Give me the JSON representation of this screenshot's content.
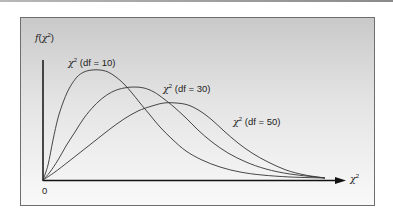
{
  "chart_data": {
    "type": "line",
    "title": "",
    "xlabel": "χ²",
    "ylabel": "f(χ²)",
    "origin_label": "0",
    "grid": false,
    "legend": "inline labels",
    "series": [
      {
        "name": "χ² (df = 10)",
        "df": 10,
        "label_pos": [
          68,
          57
        ],
        "points": [
          [
            43,
            180
          ],
          [
            48,
            165
          ],
          [
            53,
            140
          ],
          [
            58,
            118
          ],
          [
            64,
            100
          ],
          [
            70,
            87
          ],
          [
            77,
            77
          ],
          [
            84,
            72
          ],
          [
            92,
            70
          ],
          [
            100,
            70
          ],
          [
            108,
            72
          ],
          [
            116,
            77
          ],
          [
            124,
            84
          ],
          [
            132,
            93
          ],
          [
            140,
            103
          ],
          [
            150,
            115
          ],
          [
            160,
            127
          ],
          [
            172,
            139
          ],
          [
            186,
            151
          ],
          [
            202,
            160
          ],
          [
            220,
            167
          ],
          [
            240,
            172
          ],
          [
            262,
            175
          ],
          [
            290,
            177
          ],
          [
            325,
            178
          ]
        ]
      },
      {
        "name": "χ² (df = 30)",
        "df": 30,
        "label_pos": [
          163,
          83
        ],
        "points": [
          [
            43,
            180
          ],
          [
            50,
            172
          ],
          [
            58,
            160
          ],
          [
            66,
            146
          ],
          [
            75,
            132
          ],
          [
            84,
            118
          ],
          [
            94,
            106
          ],
          [
            104,
            97
          ],
          [
            114,
            91
          ],
          [
            124,
            88
          ],
          [
            134,
            87
          ],
          [
            144,
            88
          ],
          [
            154,
            92
          ],
          [
            164,
            99
          ],
          [
            174,
            107
          ],
          [
            186,
            118
          ],
          [
            198,
            130
          ],
          [
            212,
            142
          ],
          [
            228,
            153
          ],
          [
            246,
            162
          ],
          [
            266,
            169
          ],
          [
            290,
            174
          ],
          [
            325,
            178
          ]
        ]
      },
      {
        "name": "χ² (df = 50)",
        "df": 50,
        "label_pos": [
          233,
          116
        ],
        "points": [
          [
            43,
            180
          ],
          [
            55,
            172
          ],
          [
            68,
            162
          ],
          [
            82,
            151
          ],
          [
            96,
            140
          ],
          [
            110,
            129
          ],
          [
            124,
            119
          ],
          [
            138,
            111
          ],
          [
            152,
            106
          ],
          [
            164,
            103
          ],
          [
            176,
            103
          ],
          [
            188,
            105
          ],
          [
            200,
            111
          ],
          [
            212,
            120
          ],
          [
            224,
            131
          ],
          [
            238,
            143
          ],
          [
            252,
            153
          ],
          [
            268,
            162
          ],
          [
            286,
            170
          ],
          [
            305,
            175
          ],
          [
            325,
            178
          ]
        ]
      }
    ]
  }
}
